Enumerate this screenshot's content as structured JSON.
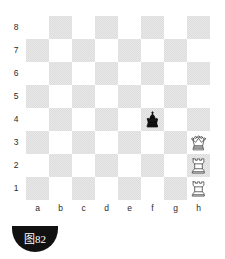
{
  "diagram": {
    "kind": "chess-diagram",
    "caption": "图82",
    "orientation": "white-bottom"
  },
  "board": {
    "files": [
      "a",
      "b",
      "c",
      "d",
      "e",
      "f",
      "g",
      "h"
    ],
    "ranks": [
      "8",
      "7",
      "6",
      "5",
      "4",
      "3",
      "2",
      "1"
    ],
    "light_square_color": "#ffffff",
    "dark_square_color": "#e3e3e3",
    "label_color": "#2a2a2a"
  },
  "pieces": [
    {
      "square": "f4",
      "color": "black",
      "type": "king",
      "glyph": "♚",
      "file_index": 5,
      "rank_index": 4
    },
    {
      "square": "h3",
      "color": "white",
      "type": "queen",
      "glyph": "♕",
      "file_index": 7,
      "rank_index": 5
    },
    {
      "square": "h2",
      "color": "white",
      "type": "rook",
      "glyph": "♖",
      "file_index": 7,
      "rank_index": 6
    },
    {
      "square": "h1",
      "color": "white",
      "type": "rook",
      "glyph": "♖",
      "file_index": 7,
      "rank_index": 7
    }
  ],
  "caption": {
    "label": "图82",
    "background_color": "#111111",
    "text_color": "#ffffff"
  }
}
